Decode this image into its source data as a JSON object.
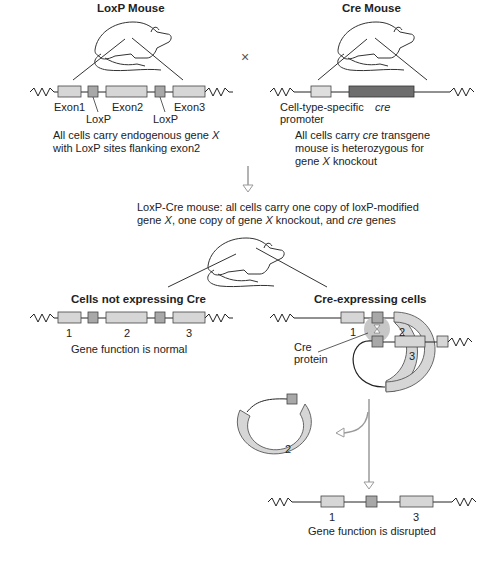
{
  "panels": {
    "loxp_mouse": {
      "title": "LoxP Mouse",
      "labels": {
        "exon1": "Exon1",
        "exon2": "Exon2",
        "exon3": "Exon3",
        "loxp_a": "LoxP",
        "loxp_b": "LoxP"
      },
      "caption_line1": "All cells carry endogenous gene ",
      "caption_gene": "X",
      "caption_line2": "with LoxP sites flanking exon2"
    },
    "cross_symbol": "×",
    "cre_mouse": {
      "title": "Cre Mouse",
      "promoter_label_1": "Cell-type-specific",
      "promoter_label_2": "promoter",
      "cre_label": "cre",
      "caption_line1_pre": "All cells carry ",
      "caption_line1_it": "cre",
      "caption_line1_post": " transgene",
      "caption_line2": "mouse is heterozygous for",
      "caption_line3_pre": "gene ",
      "caption_line3_it": "X",
      "caption_line3_post": " knockout"
    },
    "loxp_cre_mouse": {
      "line1": "LoxP-Cre mouse: all cells carry one copy of loxP-modified",
      "line2_a": "gene ",
      "line2_b": "X",
      "line2_c": ", one copy of gene ",
      "line2_d": "X",
      "line2_e": " knockout, and ",
      "line2_f": "cre",
      "line2_g": " genes"
    },
    "not_expressing": {
      "title": "Cells not expressing Cre",
      "exon_numbers": [
        "1",
        "2",
        "3"
      ],
      "caption": "Gene function is normal"
    },
    "expressing": {
      "title": "Cre-expressing cells",
      "exon_numbers": [
        "1",
        "2",
        "3"
      ],
      "cre_protein_1": "Cre",
      "cre_protein_2": "protein",
      "excised_exon": "2",
      "result_numbers": [
        "1",
        "3"
      ],
      "caption": "Gene function is disrupted"
    }
  },
  "colors": {
    "exon_fill": "#d6d6d6",
    "loxp_fill": "#a8a8a8",
    "cre_fill": "#6e6e6e",
    "cre_protein": "#bdbdbd",
    "arrow": "#9a9a9a",
    "line": "#222222"
  }
}
